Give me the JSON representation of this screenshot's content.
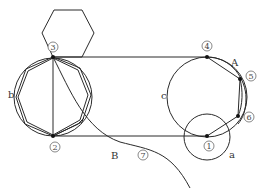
{
  "diagram": {
    "type": "geometric-construction",
    "background": "#ffffff",
    "line_color": "#2a2a2a",
    "labels": {
      "a": "a",
      "b": "b",
      "c": "c",
      "A": "A",
      "B": "B"
    },
    "points": [
      {
        "id": "p1",
        "number": "1",
        "x": 207,
        "y": 136
      },
      {
        "id": "p2",
        "number": "2",
        "x": 53,
        "y": 136
      },
      {
        "id": "p3",
        "number": "3",
        "x": 53,
        "y": 57
      },
      {
        "id": "p4",
        "number": "4",
        "x": 207,
        "y": 57
      },
      {
        "id": "p5",
        "number": "5",
        "x": 240,
        "y": 79
      },
      {
        "id": "p6",
        "number": "6",
        "x": 238,
        "y": 116
      },
      {
        "id": "p7",
        "number": "7",
        "x": 143,
        "y": 154
      }
    ],
    "circles": [
      {
        "name": "a",
        "cx": 207,
        "cy": 137,
        "r": 23
      },
      {
        "name": "b",
        "cx": 53,
        "cy": 97,
        "r": 38
      },
      {
        "name": "c",
        "cx": 207,
        "cy": 97,
        "r": 40
      }
    ]
  }
}
